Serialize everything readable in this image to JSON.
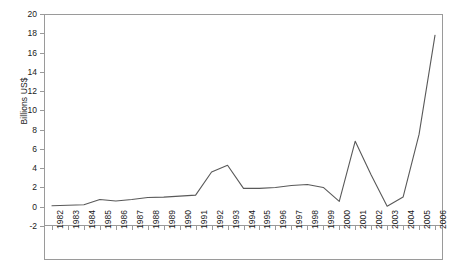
{
  "chart_data": {
    "type": "line",
    "title": "",
    "xlabel": "",
    "ylabel": "Billions US$",
    "ylim": [
      -2,
      20
    ],
    "ytick_step": 2,
    "yticks": [
      20,
      18,
      16,
      14,
      12,
      10,
      8,
      6,
      4,
      2,
      0,
      -2
    ],
    "grid": false,
    "legend": "none",
    "line_color": "#595959",
    "axis_color": "#9a9a9a",
    "categories": [
      "1982",
      "1983",
      "1984",
      "1985",
      "1986",
      "1987",
      "1988",
      "1989",
      "1990",
      "1991",
      "1992",
      "1993",
      "1994",
      "1995",
      "1996",
      "1997",
      "1998",
      "1999",
      "2000",
      "2001",
      "2002",
      "2003",
      "2004",
      "2005",
      "2006"
    ],
    "series": [
      {
        "name": "Billions US$",
        "values": [
          0.1,
          0.15,
          0.2,
          0.75,
          0.6,
          0.75,
          0.95,
          1.0,
          1.1,
          1.2,
          3.6,
          4.3,
          1.9,
          1.9,
          2.0,
          2.2,
          2.3,
          2.0,
          0.55,
          6.8,
          3.3,
          0.05,
          1.0,
          7.5,
          17.8
        ]
      }
    ]
  },
  "axis": {
    "y_title": "Billions US$"
  }
}
